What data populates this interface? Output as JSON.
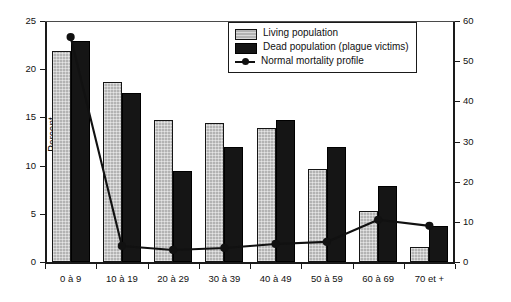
{
  "chart_data": {
    "type": "bar",
    "title": "",
    "subtitle": "",
    "xlabel": "",
    "ylabel": "Percent",
    "y2label": "",
    "categories": [
      "0 à 9",
      "10 à 19",
      "20 à 29",
      "30 à 39",
      "40 à 49",
      "50 à 59",
      "60 à 69",
      "70 et +"
    ],
    "ylim": [
      0,
      25
    ],
    "yticks": [
      0,
      5,
      10,
      15,
      20,
      25
    ],
    "y2lim": [
      0,
      60
    ],
    "y2ticks": [
      0,
      10,
      20,
      30,
      40,
      50,
      60
    ],
    "grid": false,
    "legend_position": "top-right",
    "series": [
      {
        "name": "Living population",
        "type": "bar",
        "axis": "left",
        "color": "#b3b3b3",
        "values": [
          21.9,
          18.7,
          14.7,
          14.4,
          13.9,
          9.7,
          5.3,
          1.6
        ]
      },
      {
        "name": "Dead population (plague victims)",
        "type": "bar",
        "axis": "left",
        "color": "#151515",
        "values": [
          22.9,
          17.5,
          9.4,
          11.9,
          14.7,
          11.9,
          7.9,
          3.7
        ]
      },
      {
        "name": "Normal mortality profile",
        "type": "line",
        "axis": "right",
        "color": "#111111",
        "marker": "circle",
        "values": [
          56.0,
          4.0,
          3.0,
          3.5,
          4.5,
          5.0,
          10.5,
          9.0
        ]
      }
    ]
  },
  "legend": {
    "items": [
      {
        "label": "Living population",
        "key": "swatch-living"
      },
      {
        "label": "Dead population (plague victims)",
        "key": "swatch-dead"
      },
      {
        "label": "Normal mortality profile",
        "key": "line-marker"
      }
    ]
  },
  "colors": {
    "living_bar": "#b3b3b3",
    "dead_bar": "#151515",
    "line": "#111111",
    "axis": "#1a1a1a",
    "background": "#ffffff"
  }
}
